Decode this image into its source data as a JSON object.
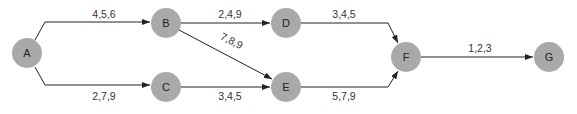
{
  "diagram": {
    "type": "network-activity-diagram",
    "node_color": "#a9a9a9",
    "nodes": [
      {
        "id": "A",
        "label": "A",
        "x": 27,
        "y": 53
      },
      {
        "id": "B",
        "label": "B",
        "x": 166,
        "y": 23
      },
      {
        "id": "C",
        "label": "C",
        "x": 166,
        "y": 87
      },
      {
        "id": "D",
        "label": "D",
        "x": 286,
        "y": 23
      },
      {
        "id": "E",
        "label": "E",
        "x": 286,
        "y": 87
      },
      {
        "id": "F",
        "label": "F",
        "x": 406,
        "y": 57
      },
      {
        "id": "G",
        "label": "G",
        "x": 549,
        "y": 57
      }
    ],
    "edges": [
      {
        "from": "A",
        "to": "B",
        "label": "4,5,6"
      },
      {
        "from": "A",
        "to": "C",
        "label": "2,7,9"
      },
      {
        "from": "B",
        "to": "D",
        "label": "2,4,9"
      },
      {
        "from": "B",
        "to": "E",
        "label": "7,8,9"
      },
      {
        "from": "C",
        "to": "E",
        "label": "3,4,5"
      },
      {
        "from": "D",
        "to": "F",
        "label": "3,4,5"
      },
      {
        "from": "E",
        "to": "F",
        "label": "5,7,9"
      },
      {
        "from": "F",
        "to": "G",
        "label": "1,2,3"
      }
    ]
  }
}
